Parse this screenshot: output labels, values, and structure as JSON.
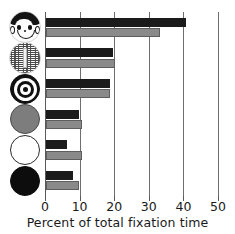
{
  "chart_data": {
    "type": "bar",
    "orientation": "horizontal",
    "title": "",
    "xlabel": "Percent of total fixation time",
    "ylabel": "",
    "xlim": [
      0,
      50
    ],
    "xticks": [
      0,
      10,
      20,
      30,
      40,
      50
    ],
    "xtick_labels": [
      "0",
      "10",
      "20",
      "30",
      "40",
      "50"
    ],
    "grid": "vertical",
    "legend": "none",
    "categories": [
      "face",
      "scrambled-face",
      "bullseye",
      "gray-disk",
      "white-disk",
      "black-disk"
    ],
    "category_icons": [
      "face-icon",
      "scrambled-face-icon",
      "bullseye-icon",
      "gray-disk-icon",
      "white-disk-icon",
      "black-disk-icon"
    ],
    "series": [
      {
        "name": "black-series",
        "color": "#1b1b1b",
        "values": [
          40.5,
          19.5,
          18.5,
          9.5,
          6.0,
          7.7
        ]
      },
      {
        "name": "gray-series",
        "color": "#8a8a8a",
        "values": [
          33.0,
          20.0,
          18.5,
          10.5,
          10.5,
          9.5
        ]
      }
    ]
  },
  "axis": {
    "title": "Percent of total fixation time",
    "ticks": [
      "0",
      "10",
      "20",
      "30",
      "40",
      "50"
    ]
  },
  "colors": {
    "black_bar": "#1b1b1b",
    "gray_bar": "#8a8a8a",
    "gridline": "#6e6e6e",
    "background": "#ffffff",
    "text": "#1a1a1a"
  }
}
